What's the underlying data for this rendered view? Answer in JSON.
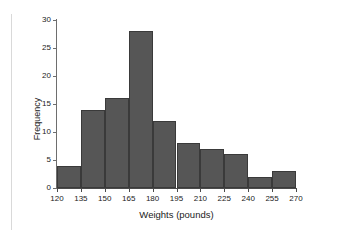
{
  "chart_data": {
    "type": "bar",
    "title": "",
    "subtitle": "",
    "xlabel": "Weights (pounds)",
    "ylabel": "Frequency",
    "xlim": [
      120,
      270
    ],
    "ylim": [
      0,
      30
    ],
    "bin_width": 15,
    "grid": false,
    "legend": null,
    "bar_color": "#565656",
    "bar_edge_color": "#3a3a3a",
    "background_color": "#ffffff",
    "axis_color": "#4a4a4a",
    "x_ticks": [
      120,
      135,
      150,
      165,
      180,
      195,
      210,
      225,
      240,
      255,
      270
    ],
    "x_tick_labels": [
      "120",
      "135",
      "150",
      "165",
      "180",
      "195",
      "210",
      "225",
      "240",
      "255",
      "270"
    ],
    "y_ticks": [
      0,
      5,
      10,
      15,
      20,
      25,
      30
    ],
    "y_tick_labels": [
      "0",
      "5",
      "10",
      "15",
      "20",
      "25",
      "30"
    ],
    "categories": [
      "120-135",
      "135-150",
      "150-165",
      "165-180",
      "180-195",
      "195-210",
      "210-225",
      "225-240",
      "240-255",
      "255-270"
    ],
    "bin_edges": [
      120,
      135,
      150,
      165,
      180,
      195,
      210,
      225,
      240,
      255,
      270
    ],
    "values": [
      4,
      14,
      16,
      28,
      12,
      8,
      7,
      6,
      2,
      3
    ],
    "annotations": []
  }
}
